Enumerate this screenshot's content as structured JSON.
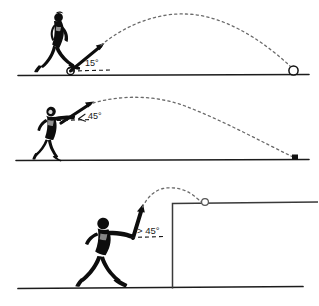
{
  "figure": {
    "ink_color": "#111111",
    "ground_color": "#222222",
    "trajectory_color": "#555555",
    "panels": [
      {
        "id": "panel-shot-put-15",
        "index": 1,
        "angle_label": "15°",
        "angle_value": 15,
        "thrower": "shot-putter-figure",
        "projectile": "shot-ball",
        "landing_marker": "ball-circle",
        "ground_y": 75,
        "launch_x": 70,
        "launch_y": 71,
        "apex_x": 186,
        "apex_y": 22,
        "landing_x": 293,
        "landing_y": 73
      },
      {
        "id": "panel-javelin-45",
        "index": 2,
        "angle_label": "45°",
        "angle_value": 45,
        "angle_prefix_icon": "angle-wedge-icon",
        "thrower": "javelin-thrower-figure",
        "projectile": "javelin",
        "landing_marker": "javelin-tip-mark",
        "ground_y": 160,
        "launch_x": 68,
        "launch_y": 120,
        "apex_x": 180,
        "apex_y": 100,
        "landing_x": 297,
        "landing_y": 158
      },
      {
        "id": "panel-over-wall-45",
        "index": 3,
        "angle_label": "> 45°",
        "angle_value": 45,
        "angle_comparator": ">",
        "thrower": "thrower-figure",
        "projectile": "javelin",
        "landing_marker": "landing-circle-on-wall",
        "obstacle": "wall",
        "ground_y": 288,
        "launch_x": 137,
        "launch_y": 235,
        "apex_x": 176,
        "apex_y": 190,
        "landing_x": 205,
        "landing_y": 202,
        "wall_left_x": 172,
        "wall_top_y": 203,
        "wall_right_x": 318
      }
    ]
  }
}
